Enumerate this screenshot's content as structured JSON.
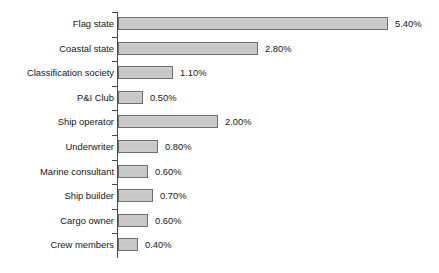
{
  "chart_data": {
    "type": "bar",
    "orientation": "horizontal",
    "title": "",
    "subtitle": "",
    "xlabel": "",
    "ylabel": "",
    "xlim": [
      0,
      5.6
    ],
    "grid": false,
    "legend": null,
    "value_suffix": "%",
    "categories": [
      "Flag state",
      "Coastal state",
      "Classification society",
      "P&I Club",
      "Ship operator",
      "Underwriter",
      "Marine consultant",
      "Ship builder",
      "Cargo owner",
      "Crew members"
    ],
    "values": [
      5.4,
      2.8,
      1.1,
      0.5,
      2.0,
      0.8,
      0.6,
      0.7,
      0.6,
      0.4
    ],
    "value_labels": [
      "5.40%",
      "2.80%",
      "1.10%",
      "0.50%",
      "2.00%",
      "0.80%",
      "0.60%",
      "0.70%",
      "0.60%",
      "0.40%"
    ],
    "colors": {
      "bar_fill": "#c9c9c9",
      "bar_border": "#6e6e6e",
      "axis": "#4a4a4a",
      "text": "#161616",
      "background": "#ffffff"
    },
    "px_per_unit": 50,
    "axis_x_px": 118
  }
}
